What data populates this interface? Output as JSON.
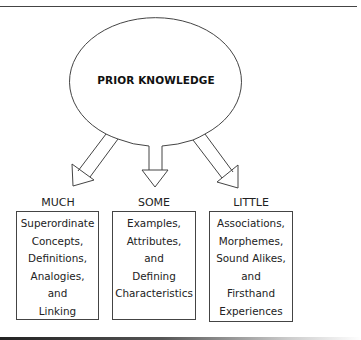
{
  "diagram": {
    "center_node": {
      "label": "PRIOR KNOWLEDGE",
      "shape": "ellipse"
    },
    "branches": [
      {
        "label": "MUCH",
        "lines": [
          "Superordinate",
          "Concepts,",
          "Definitions,",
          "Analogies,",
          "and",
          "Linking"
        ]
      },
      {
        "label": "SOME",
        "lines": [
          "Examples,",
          "Attributes,",
          "and",
          "Defining",
          "Characteristics"
        ]
      },
      {
        "label": "LITTLE",
        "lines": [
          "Associations,",
          "Morphemes,",
          "Sound Alikes,",
          "and",
          "Firsthand",
          "Experiences"
        ]
      }
    ],
    "colors": {
      "stroke": "#444444",
      "text": "#222222",
      "background": "#ffffff"
    }
  }
}
